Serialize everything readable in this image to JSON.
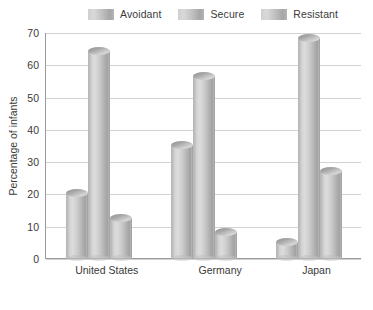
{
  "chart_data": {
    "type": "bar",
    "title": "",
    "subtitle": "",
    "xlabel": "",
    "ylabel": "Percentage of infants",
    "ylim": [
      0,
      70
    ],
    "ytick_step": 10,
    "yticks": [
      "70",
      "60",
      "50",
      "40",
      "30",
      "20",
      "10",
      "0"
    ],
    "grid": true,
    "legend_position": "top",
    "categories": [
      "United States",
      "Germany",
      "Japan"
    ],
    "series": [
      {
        "name": "Avoidant",
        "values": [
          20,
          35,
          5
        ]
      },
      {
        "name": "Secure",
        "values": [
          64,
          56.5,
          68
        ]
      },
      {
        "name": "Resistant",
        "values": [
          12.5,
          8,
          27
        ]
      }
    ],
    "colors": {
      "background": "#ffffff",
      "gridline": "#d2d2d2",
      "axis": "#9a9a9a",
      "text": "#3a3a3a",
      "bar_light": "#dcdcdc",
      "bar_mid": "#c9c9c9",
      "bar_dark": "#a2a2a2",
      "bar_top": "#8f8f8f"
    }
  },
  "legend": {
    "items": [
      {
        "label": "Avoidant"
      },
      {
        "label": "Secure"
      },
      {
        "label": "Resistant"
      }
    ]
  },
  "axis": {
    "y_title": "Percentage of infants"
  }
}
